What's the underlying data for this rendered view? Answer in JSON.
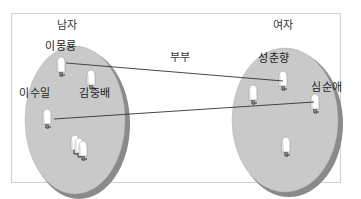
{
  "diagram": {
    "groups": [
      {
        "id": "men",
        "label": "남자",
        "members": [
          "이몽룡",
          "김중배",
          "이수일"
        ],
        "unnamed_members": 3
      },
      {
        "id": "women",
        "label": "여자",
        "members": [
          "성춘향",
          "심순애"
        ],
        "unnamed_members": 2
      }
    ],
    "relationship_label": "부부",
    "relations": [
      {
        "from": "이몽룡",
        "to": "성춘향"
      },
      {
        "from": "이수일",
        "to": "심순애"
      }
    ],
    "colors": {
      "ellipse_fill": "#c9c9c9",
      "ellipse_shadow": "#8a8a8a",
      "frame_border": "#d0d0d0",
      "line": "#333333",
      "figure": "#ffffff"
    }
  }
}
